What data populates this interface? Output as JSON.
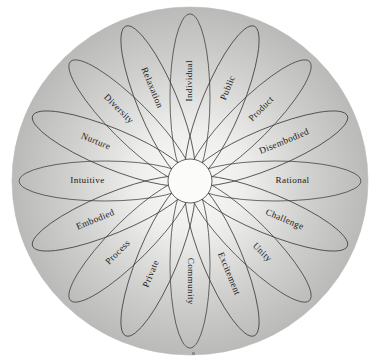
{
  "figure": {
    "shape": "circular-petal-wheel",
    "petal_count": 16,
    "background_color": "#ffffff",
    "disc_color_outer": "#b9b9b9",
    "disc_color_inner": "#f2f2f0",
    "line_color": "#3b3b3b",
    "hub_color": "#fbfbfa",
    "disc": {
      "cx": 190,
      "cy": 181,
      "rx": 178,
      "ry": 174
    },
    "hub": {
      "cx": 190,
      "cy": 181,
      "r": 22
    },
    "footer_mark": "·"
  },
  "petals": [
    {
      "label": "Individual",
      "angle_deg": 0
    },
    {
      "label": "Public",
      "angle_deg": 22.5
    },
    {
      "label": "Product",
      "angle_deg": 45
    },
    {
      "label": "Disembodied",
      "angle_deg": 67.5
    },
    {
      "label": "Rational",
      "angle_deg": 90
    },
    {
      "label": "Challenge",
      "angle_deg": 112.5
    },
    {
      "label": "Unity",
      "angle_deg": 135
    },
    {
      "label": "Excitement",
      "angle_deg": 157.5
    },
    {
      "label": "Community",
      "angle_deg": 180
    },
    {
      "label": "Private",
      "angle_deg": 202.5
    },
    {
      "label": "Process",
      "angle_deg": 225
    },
    {
      "label": "Embodied",
      "angle_deg": 247.5
    },
    {
      "label": "Intuitive",
      "angle_deg": 270
    },
    {
      "label": "Nurture",
      "angle_deg": 292.5
    },
    {
      "label": "Diversity",
      "angle_deg": 315
    },
    {
      "label": "Relaxation",
      "angle_deg": 337.5
    }
  ],
  "chart_data": {
    "type": "pie",
    "title": "",
    "categories": [
      "Individual",
      "Public",
      "Product",
      "Disembodied",
      "Rational",
      "Challenge",
      "Unity",
      "Excitement",
      "Community",
      "Private",
      "Process",
      "Embodied",
      "Intuitive",
      "Nurture",
      "Diversity",
      "Relaxation"
    ],
    "values": [
      1,
      1,
      1,
      1,
      1,
      1,
      1,
      1,
      1,
      1,
      1,
      1,
      1,
      1,
      1,
      1
    ],
    "xlabel": "",
    "ylabel": "",
    "legend_position": "none",
    "grid": false,
    "opposite_pairs": [
      [
        "Individual",
        "Community"
      ],
      [
        "Public",
        "Private"
      ],
      [
        "Product",
        "Process"
      ],
      [
        "Disembodied",
        "Embodied"
      ],
      [
        "Rational",
        "Intuitive"
      ],
      [
        "Challenge",
        "Nurture"
      ],
      [
        "Unity",
        "Diversity"
      ],
      [
        "Excitement",
        "Relaxation"
      ]
    ]
  }
}
